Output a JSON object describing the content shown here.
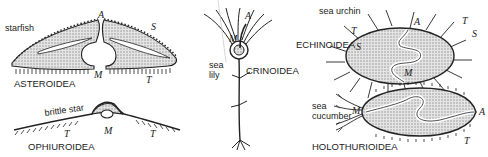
{
  "diagram": {
    "panels": [
      {
        "id": "asteroidea",
        "common_name": "starfish",
        "class_name": "ASTEROIDEA",
        "markers": {
          "A": "A",
          "S": "S",
          "M": "M",
          "T": "T"
        }
      },
      {
        "id": "ophiuroidea",
        "common_name": "brittle star",
        "class_name": "OPHIUROIDEA",
        "markers": {
          "T1": "T",
          "M": "M",
          "T2": "T"
        }
      },
      {
        "id": "crinoidea",
        "common_name_line1": "sea",
        "common_name_line2": "lily",
        "class_name": "CRINOIDEA",
        "markers": {
          "A": "A",
          "M": "M"
        }
      },
      {
        "id": "echinoidea",
        "common_name": "sea urchin",
        "class_name": "ECHINOIDEA",
        "markers": {
          "A": "A",
          "T_left": "T",
          "S_left": "S",
          "T_right": "T",
          "S_right": "S",
          "M": "M"
        }
      },
      {
        "id": "holothurioidea",
        "common_name_line1": "sea",
        "common_name_line2": "cucumber",
        "class_name": "HOLOTHURIOIDEA",
        "markers": {
          "M": "M",
          "A": "A",
          "T": "T"
        }
      }
    ],
    "colors": {
      "ink": "#222222",
      "stipple": "#c9c9c9",
      "background": "#ffffff"
    }
  }
}
